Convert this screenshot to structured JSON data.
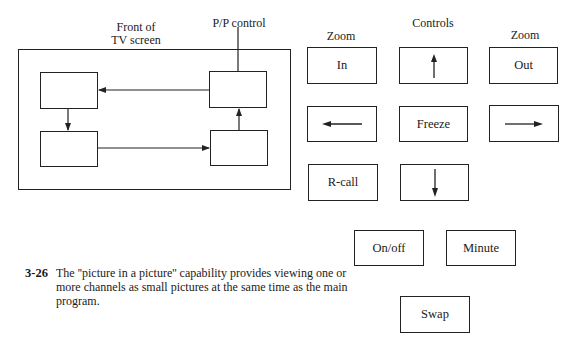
{
  "diagram": {
    "tv_screen_label_line1": "Front of",
    "tv_screen_label_line2": "TV screen",
    "pp_control_label": "P/P control",
    "flow": [
      {
        "from": "top-right-box",
        "to": "top-left-box",
        "direction": "left"
      },
      {
        "from": "top-left-box",
        "to": "bottom-left-box",
        "direction": "down"
      },
      {
        "from": "bottom-left-box",
        "to": "bottom-right-box",
        "direction": "right"
      },
      {
        "from": "bottom-right-box",
        "to": "top-right-box",
        "direction": "up"
      }
    ]
  },
  "controls": {
    "title": "Controls",
    "zoom_in_header": "Zoom",
    "zoom_out_header": "Zoom",
    "buttons": {
      "zoom_in": "In",
      "up": "up-arrow-icon",
      "zoom_out": "Out",
      "left": "left-arrow-icon",
      "freeze": "Freeze",
      "right": "right-arrow-icon",
      "recall": "R-call",
      "down": "down-arrow-icon",
      "on_off": "On/off",
      "minute": "Minute",
      "swap": "Swap"
    }
  },
  "caption": {
    "number": "3-26",
    "line1": "The ''picture in a picture'' capability provides viewing one or",
    "line2": "more channels as small pictures at the same time as the main",
    "line3": "program."
  },
  "colors": {
    "ink": "#222222",
    "background": "#ffffff"
  }
}
